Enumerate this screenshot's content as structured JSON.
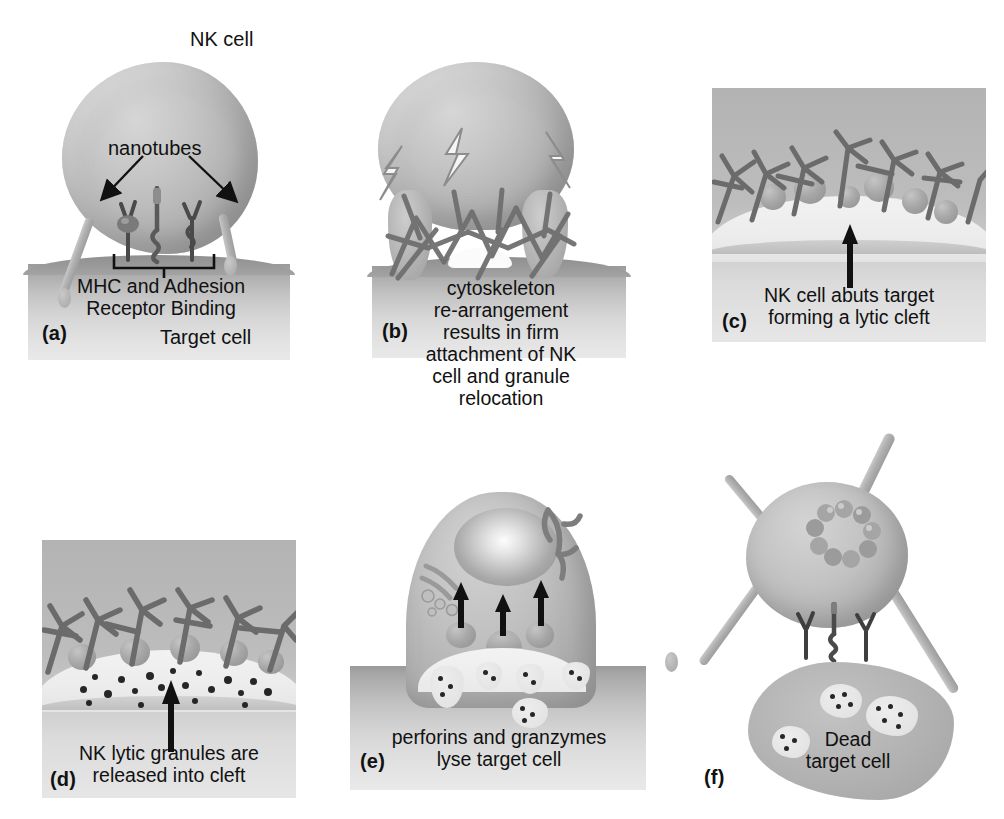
{
  "figure": {
    "title_text": "NK cell",
    "background_color": "#ffffff",
    "cell_fill": "#b8b8b8",
    "text_color": "#111111"
  },
  "panels": [
    {
      "id": "a",
      "label": "(a)",
      "annotations": {
        "nk_cell": "NK cell",
        "nanotubes": "nanotubes",
        "receptor": "MHC and Adhesion\nReceptor Binding",
        "target_cell": "Target cell"
      }
    },
    {
      "id": "b",
      "label": "(b)",
      "caption": "cytoskeleton\nre-arrangement\nresults in firm\nattachment of NK\ncell and granule\nrelocation"
    },
    {
      "id": "c",
      "label": "(c)",
      "caption": "NK cell abuts target\nforming a lytic cleft"
    },
    {
      "id": "d",
      "label": "(d)",
      "caption": "NK lytic granules are\nreleased into cleft"
    },
    {
      "id": "e",
      "label": "(e)",
      "caption": "perforins and granzymes\nlyse target cell"
    },
    {
      "id": "f",
      "label": "(f)",
      "caption": "Dead\ntarget cell"
    }
  ]
}
